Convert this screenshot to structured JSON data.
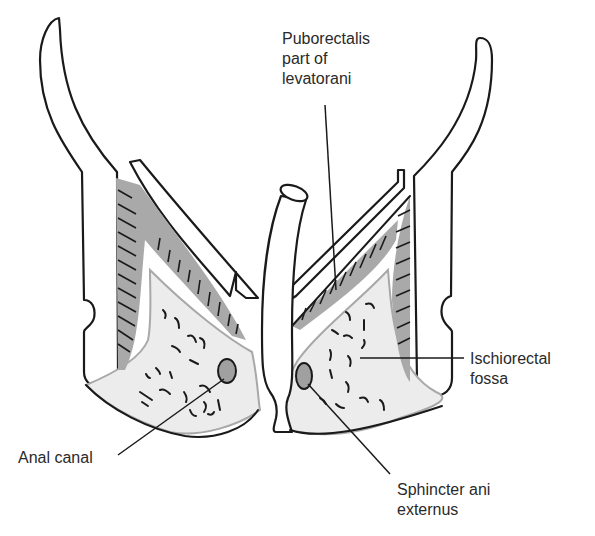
{
  "diagram": {
    "type": "anatomical-cross-section",
    "labels": {
      "puborectalis": [
        "Puborectalis",
        "part of",
        "levatorani"
      ],
      "ischiorectal_fossa": [
        "Ischiorectal",
        "fossa"
      ],
      "anal_canal": [
        "Anal canal"
      ],
      "sphincter": [
        "Sphincter ani",
        "externus"
      ]
    },
    "colors": {
      "outline": "#1a1a1a",
      "fat": "#ececec",
      "muscle": "#a9a9a9",
      "text": "#2a2a2a"
    }
  }
}
